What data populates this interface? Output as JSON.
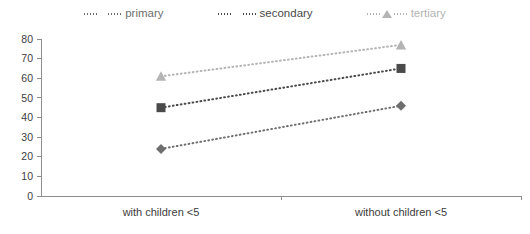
{
  "legend": {
    "position": "top-center",
    "items": [
      {
        "label": "primary",
        "marker": "diamond-marker-icon",
        "color": "#6e6e6e"
      },
      {
        "label": "secondary",
        "marker": "square-marker-icon",
        "color": "#4a4a4a"
      },
      {
        "label": "tertiary",
        "marker": "triangle-marker-icon",
        "color": "#b4b4b4"
      }
    ]
  },
  "axes": {
    "y_ticks": [
      "0",
      "10",
      "20",
      "30",
      "40",
      "50",
      "60",
      "70",
      "80"
    ],
    "x_categories": [
      "with children <5",
      "without children <5"
    ]
  },
  "chart_data": {
    "type": "line",
    "title": "",
    "xlabel": "",
    "ylabel": "",
    "categories": [
      "with children <5",
      "without children <5"
    ],
    "x": [
      0,
      1
    ],
    "ylim": [
      0,
      80
    ],
    "ytick_step": 10,
    "grid": false,
    "legend_position": "top-center",
    "series": [
      {
        "name": "primary",
        "values": [
          24,
          46
        ],
        "color": "#6e6e6e",
        "marker": "diamond",
        "linestyle": "dotted"
      },
      {
        "name": "secondary",
        "values": [
          45,
          65
        ],
        "color": "#4a4a4a",
        "marker": "square",
        "linestyle": "dotted"
      },
      {
        "name": "tertiary",
        "values": [
          61,
          77
        ],
        "color": "#b4b4b4",
        "marker": "triangle",
        "linestyle": "dotted"
      }
    ]
  }
}
